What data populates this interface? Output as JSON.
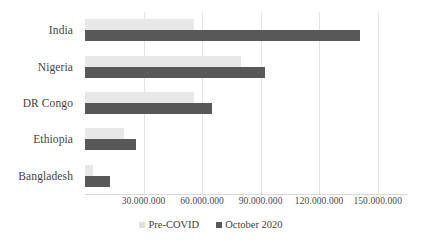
{
  "chart_data": {
    "type": "bar",
    "orientation": "horizontal",
    "title": "",
    "subtitle": "",
    "xlabel": "",
    "ylabel": "",
    "categories": [
      "India",
      "Nigeria",
      "DR Congo",
      "Ethiopia",
      "Bangladesh"
    ],
    "series": [
      {
        "name": "Pre-COVID",
        "color": "#e8e8e8",
        "values": [
          56000000,
          80000000,
          56000000,
          20000000,
          4000000
        ]
      },
      {
        "name": "October 2020",
        "color": "#585858",
        "values": [
          141000000,
          92000000,
          65000000,
          26000000,
          13000000
        ]
      }
    ],
    "xlim": [
      0,
      165000000
    ],
    "x_ticks": [
      30000000,
      60000000,
      90000000,
      120000000,
      150000000
    ],
    "x_tick_labels": [
      "30.000.000",
      "60.000.000",
      "90.000.000",
      "120.000.000",
      "150.000.000"
    ],
    "grid": true,
    "grid_axis": "x",
    "legend_position": "bottom",
    "background_color": "#ffffff",
    "text_color": "#3f3f3f",
    "gridline_color": "#e3e3e3"
  },
  "legend": {
    "items": [
      {
        "label": "Pre-COVID",
        "marker": "square-marker",
        "color": "#e0e0e0"
      },
      {
        "label": "October 2020",
        "marker": "square-marker",
        "color": "#585858"
      }
    ]
  }
}
